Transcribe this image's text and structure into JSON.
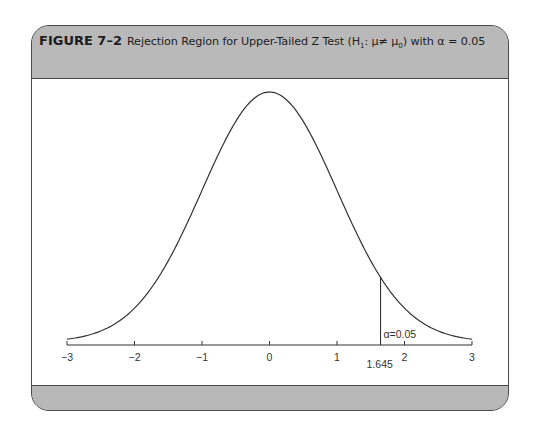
{
  "figure": {
    "number": "FIGURE 7–2",
    "title_text": "Rejection Region for Upper-Tailed Z Test (H",
    "title_sub": "1",
    "title_mid": ": μ≠ μ",
    "title_sub2": "0",
    "title_end": ") with α = 0.05"
  },
  "chart_data": {
    "type": "line",
    "xlabel": "",
    "ylabel": "",
    "xlim": [
      -3,
      3
    ],
    "x_ticks": [
      -3,
      -2,
      -1,
      0,
      1,
      2,
      3
    ],
    "x_tick_labels": [
      "−3",
      "−2",
      "−1",
      "0",
      "1",
      "2",
      "3"
    ],
    "series": [
      {
        "name": "Standard normal density",
        "function": "N(0,1) pdf",
        "x_range": [
          -3,
          3
        ]
      }
    ],
    "critical_value": 1.645,
    "critical_value_label": "1.645",
    "rejection_region": {
      "from": 1.645,
      "to": 3,
      "label": "α=0.05"
    },
    "grid": false,
    "legend": null
  },
  "axis": {
    "ticks": [
      "−3",
      "−2",
      "−1",
      "0",
      "1",
      "2",
      "3"
    ],
    "critical_label": "1.645",
    "alpha_label": "α=0.05"
  },
  "colors": {
    "header_bg": "#b9b9b9",
    "frame_border": "#4a4a4a",
    "curve": "#333333",
    "body_bg": "#ffffff"
  }
}
